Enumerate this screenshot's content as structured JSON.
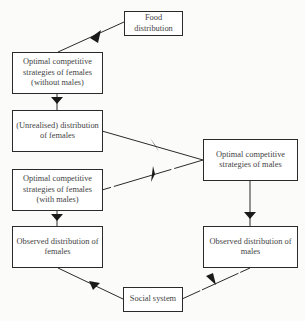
{
  "diagram": {
    "nodes": [
      {
        "id": "food",
        "label": "Food distribution",
        "lines": [
          "Food",
          "distribution"
        ]
      },
      {
        "id": "fem_opt_nomale",
        "label": "Optimal competitive strategies of females (without males)",
        "lines": [
          "Optimal competitive",
          "strategies of females",
          "(without males)"
        ]
      },
      {
        "id": "unrealised",
        "label": "(Unrealised) distribution of females",
        "lines": [
          "(Unrealised) distribution",
          "of females"
        ]
      },
      {
        "id": "fem_opt_male",
        "label": "Optimal competitive strategies of females (with males)",
        "lines": [
          "Optimal competitive",
          "strategies of females",
          "(with males)"
        ]
      },
      {
        "id": "male_opt",
        "label": "Optimal competitive strategies of males",
        "lines": [
          "Optimal competitive",
          "strategies of males"
        ]
      },
      {
        "id": "obs_fem",
        "label": "Observed distribution of females",
        "lines": [
          "Observed distribution",
          "of females"
        ]
      },
      {
        "id": "obs_male",
        "label": "Observed distribution of males",
        "lines": [
          "Observed distribution",
          "of males"
        ]
      },
      {
        "id": "social",
        "label": "Social system",
        "lines": [
          "Social system"
        ]
      }
    ],
    "edges": [
      {
        "from": "food",
        "to": "fem_opt_nomale"
      },
      {
        "from": "fem_opt_nomale",
        "to": "unrealised"
      },
      {
        "from": "unrealised",
        "to": "male_opt"
      },
      {
        "from": "male_opt",
        "to": "fem_opt_male"
      },
      {
        "from": "fem_opt_male",
        "to": "obs_fem"
      },
      {
        "from": "male_opt",
        "to": "obs_male"
      },
      {
        "from": "obs_fem",
        "to": "social"
      },
      {
        "from": "social",
        "to": "obs_male"
      }
    ]
  }
}
